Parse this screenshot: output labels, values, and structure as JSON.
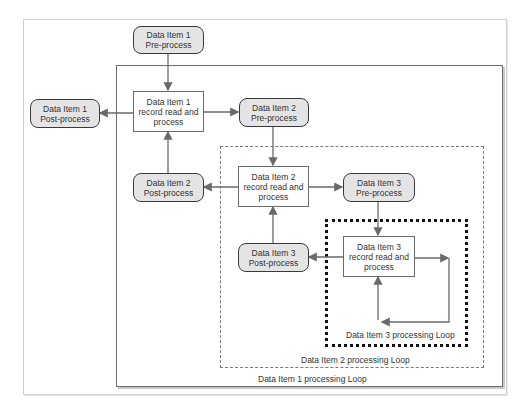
{
  "diagram": {
    "nodes": {
      "di1_pre": {
        "line1": "Data Item 1",
        "line2": "Pre-process"
      },
      "di1_record": {
        "line1": "Data Item 1",
        "line2": "record read and",
        "line3": "process"
      },
      "di1_post": {
        "line1": "Data Item 1",
        "line2": "Post-process"
      },
      "di2_pre": {
        "line1": "Data Item 2",
        "line2": "Pre-process"
      },
      "di2_record": {
        "line1": "Data Item 2",
        "line2": "record read and",
        "line3": "process"
      },
      "di2_post": {
        "line1": "Data Item 2",
        "line2": "Post-process"
      },
      "di3_pre": {
        "line1": "Data Item 3",
        "line2": "Pre-process"
      },
      "di3_record": {
        "line1": "Data Item 3",
        "line2": "record read and",
        "line3": "process"
      },
      "di3_post": {
        "line1": "Data Item 3",
        "line2": "Post-process"
      }
    },
    "loops": {
      "loop1": "Data Item 1 processing Loop",
      "loop2": "Data Item 2 processing Loop",
      "loop3": "Data Item 3 processing Loop"
    },
    "edges": [
      {
        "from": "di1_pre",
        "to": "di1_record"
      },
      {
        "from": "di1_record",
        "to": "di1_post"
      },
      {
        "from": "di1_record",
        "to": "di2_pre"
      },
      {
        "from": "di2_pre",
        "to": "di2_record"
      },
      {
        "from": "di2_post",
        "to": "di1_record"
      },
      {
        "from": "di2_record",
        "to": "di2_post"
      },
      {
        "from": "di2_record",
        "to": "di3_pre"
      },
      {
        "from": "di3_pre",
        "to": "di3_record"
      },
      {
        "from": "di3_post",
        "to": "di2_record"
      },
      {
        "from": "di3_record",
        "to": "di3_post"
      },
      {
        "from": "di3_record",
        "to": "di3_record",
        "type": "self-loop"
      }
    ],
    "colors": {
      "rounded_fill": "#e4e4e4",
      "rounded_border": "#3a3a3a",
      "arrow": "#6a6a6a"
    }
  }
}
